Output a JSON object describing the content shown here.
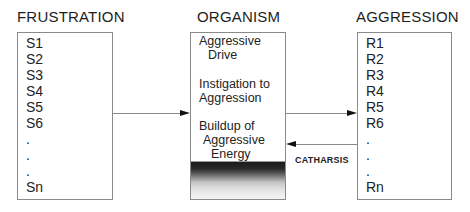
{
  "diagram": {
    "frustration": {
      "title": "FRUSTRATION",
      "items": [
        "S1",
        "S2",
        "S3",
        "S4",
        "S5",
        "S6",
        ".",
        ".",
        ".",
        "Sn"
      ]
    },
    "organism": {
      "title": "ORGANISM",
      "drive_line1": "Aggressive",
      "drive_line2": "Drive",
      "instigation_line1": "Instigation to",
      "instigation_line2": "Aggression",
      "buildup_line1": "Buildup of",
      "buildup_line2": "Aggressive",
      "buildup_line3": "Energy",
      "gauge": "energy-level-gradient"
    },
    "aggression": {
      "title": "AGGRESSION",
      "items": [
        "R1",
        "R2",
        "R3",
        "R4",
        "R5",
        "R6",
        ".",
        ".",
        ".",
        "Rn"
      ]
    },
    "arrows": {
      "frustration_to_organism": "right-arrow",
      "organism_to_aggression": "right-arrow",
      "aggression_to_organism": "left-arrow",
      "catharsis_label": "CATHARSIS"
    }
  }
}
